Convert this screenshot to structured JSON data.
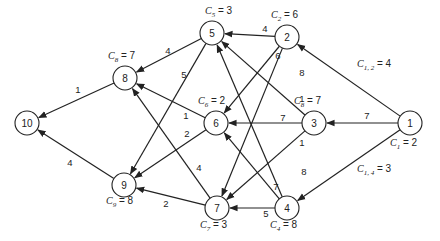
{
  "diagram": {
    "node_radius": 12,
    "nodes": [
      {
        "id": "1",
        "x": 410,
        "y": 123,
        "cost_label": "C",
        "cost_sub": "1",
        "cost_value": "2",
        "cost_x": 390,
        "cost_y": 146
      },
      {
        "id": "2",
        "x": 287,
        "y": 37,
        "cost_label": "C",
        "cost_sub": "2",
        "cost_value": "6",
        "cost_x": 271,
        "cost_y": 18
      },
      {
        "id": "3",
        "x": 314,
        "y": 123,
        "cost_label": "C",
        "cost_sub": "8",
        "cost_value": "7",
        "cost_x": 294,
        "cost_y": 104
      },
      {
        "id": "4",
        "x": 287,
        "y": 208,
        "cost_label": "C",
        "cost_sub": "4",
        "cost_value": "8",
        "cost_x": 270,
        "cost_y": 228
      },
      {
        "id": "5",
        "x": 212,
        "y": 33,
        "cost_label": "C",
        "cost_sub": "5",
        "cost_value": "3",
        "cost_x": 205,
        "cost_y": 14
      },
      {
        "id": "6",
        "x": 216,
        "y": 123,
        "cost_label": "C",
        "cost_sub": "6",
        "cost_value": "2",
        "cost_x": 198,
        "cost_y": 104
      },
      {
        "id": "7",
        "x": 217,
        "y": 208,
        "cost_label": "C",
        "cost_sub": "7",
        "cost_value": "3",
        "cost_x": 200,
        "cost_y": 228
      },
      {
        "id": "8",
        "x": 125,
        "y": 78,
        "cost_label": "C",
        "cost_sub": "8",
        "cost_value": "7",
        "cost_x": 108,
        "cost_y": 59
      },
      {
        "id": "9",
        "x": 124,
        "y": 185,
        "cost_label": "C",
        "cost_sub": "9",
        "cost_value": "8",
        "cost_x": 106,
        "cost_y": 204
      },
      {
        "id": "10",
        "x": 27,
        "y": 123,
        "cost_label": "",
        "cost_sub": "",
        "cost_value": "",
        "cost_x": 0,
        "cost_y": 0
      }
    ],
    "edges": [
      {
        "from": "1",
        "to": "2",
        "weight": "C",
        "weight_sub": "1, 2",
        "weight_value": "4",
        "lx": 375,
        "ly": 67,
        "long": true
      },
      {
        "from": "1",
        "to": "3",
        "weight": "7",
        "lx": 367,
        "ly": 115
      },
      {
        "from": "1",
        "to": "4",
        "weight": "C",
        "weight_sub": "1, 4",
        "weight_value": "3",
        "lx": 375,
        "ly": 172,
        "long": true
      },
      {
        "from": "2",
        "to": "5",
        "weight": "4",
        "lx": 265,
        "ly": 28
      },
      {
        "from": "2",
        "to": "6",
        "weight": "6",
        "lx": 278,
        "ly": 55
      },
      {
        "from": "2",
        "to": "7",
        "weight": "8",
        "lx": 302,
        "ly": 72
      },
      {
        "from": "3",
        "to": "5",
        "weight": "1",
        "lx": 302,
        "ly": 98
      },
      {
        "from": "3",
        "to": "6",
        "weight": "7",
        "lx": 283,
        "ly": 117
      },
      {
        "from": "3",
        "to": "7",
        "weight": "1",
        "lx": 302,
        "ly": 142
      },
      {
        "from": "4",
        "to": "5",
        "weight": "8",
        "lx": 304,
        "ly": 171
      },
      {
        "from": "4",
        "to": "6",
        "weight": "7",
        "lx": 276,
        "ly": 186
      },
      {
        "from": "4",
        "to": "7",
        "weight": "5",
        "lx": 266,
        "ly": 213
      },
      {
        "from": "5",
        "to": "8",
        "weight": "4",
        "lx": 168,
        "ly": 50
      },
      {
        "from": "5",
        "to": "9",
        "weight": "5",
        "lx": 184,
        "ly": 74
      },
      {
        "from": "6",
        "to": "8",
        "weight": "1",
        "lx": 186,
        "ly": 115
      },
      {
        "from": "6",
        "to": "9",
        "weight": "2",
        "lx": 187,
        "ly": 133
      },
      {
        "from": "7",
        "to": "8",
        "weight": "4",
        "lx": 199,
        "ly": 167
      },
      {
        "from": "7",
        "to": "9",
        "weight": "2",
        "lx": 166,
        "ly": 203
      },
      {
        "from": "8",
        "to": "10",
        "weight": "1",
        "lx": 78,
        "ly": 89
      },
      {
        "from": "9",
        "to": "10",
        "weight": "4",
        "lx": 70,
        "ly": 162
      }
    ]
  }
}
